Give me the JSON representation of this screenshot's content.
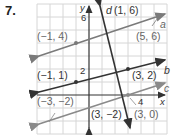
{
  "problem": {
    "number": "7."
  },
  "graph": {
    "axes": {
      "x_label": "x",
      "y_label": "y",
      "x_tick": "4",
      "y_tick_top": "6",
      "y_tick_mid": "2"
    },
    "lines": [
      {
        "name": "a",
        "points": [
          "(−1, 4)",
          "(5, 6)"
        ],
        "color": "#7a7a7a"
      },
      {
        "name": "b",
        "points": [
          "(−1, 1)",
          "(3, 2)"
        ],
        "color": "#333333"
      },
      {
        "name": "c",
        "points": [
          "(−3, −2)",
          "(3, 0)"
        ],
        "color": "#8a8a8a"
      },
      {
        "name": "d",
        "points": [
          "(1, 6)",
          "(3, −2)"
        ],
        "color": "#333333"
      }
    ],
    "labels": {
      "a": "a",
      "b": "b",
      "c": "c",
      "d": "d",
      "p_a1": "(−1, 4)",
      "p_a2": "(5, 6)",
      "p_b1": "(−1, 1)",
      "p_b2": "(3, 2)",
      "p_c1": "(−3, −2)",
      "p_c2": "(3, 0)",
      "p_d1": "(1, 6)",
      "p_d2": "(3, −2)"
    }
  }
}
